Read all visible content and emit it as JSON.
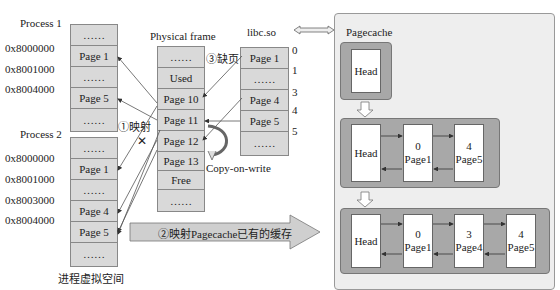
{
  "process1": {
    "title": "Process 1",
    "addresses": [
      "0x8000000",
      "0x8001000",
      "0x8004000"
    ],
    "cells": [
      "……",
      "Page 1",
      "……",
      "Page 5",
      "……"
    ]
  },
  "process2": {
    "title": "Process 2",
    "addresses": [
      "0x8000000",
      "0x8001000",
      "0x8003000",
      "0x8004000"
    ],
    "cells": [
      "……",
      "Page 1",
      "……",
      "Page 4",
      "Page 5",
      "……"
    ]
  },
  "virtual_space_label": "进程虚拟空间",
  "physical": {
    "title": "Physical frame",
    "cells": [
      "……",
      "Used",
      "Page 10",
      "Page 11",
      "Page 12",
      "Page 13",
      "Free",
      "……"
    ]
  },
  "libc": {
    "title": "libc.so",
    "cells": [
      "Page 1",
      "……",
      "Page 4",
      "Page 5",
      "……"
    ],
    "offsets": [
      "0",
      "1",
      "3",
      "4",
      "5"
    ]
  },
  "annotations": {
    "map1": "①映射",
    "fault3": "③缺页",
    "cow": "Copy-on-write",
    "map2": "②映射Pagecache已有的缓存",
    "cross": "✕"
  },
  "pagecache": {
    "title": "Pagecache",
    "head": "Head",
    "list1": [
      {
        "num": "0",
        "name": "Page1"
      },
      {
        "num": "4",
        "name": "Page5"
      }
    ],
    "list2": [
      {
        "num": "0",
        "name": "Page1"
      },
      {
        "num": "3",
        "name": "Page4"
      },
      {
        "num": "4",
        "name": "Page5"
      }
    ]
  }
}
